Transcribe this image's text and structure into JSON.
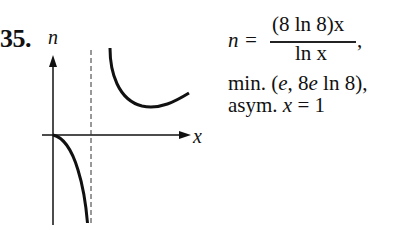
{
  "problem": {
    "number": "35."
  },
  "graph": {
    "y_axis_label": "n",
    "x_axis_label": "x",
    "asymptote": "x = 1 (dashed vertical line)",
    "curves": [
      {
        "name": "left-branch",
        "description": "from origin decreasing to -infinity as x approaches 1 from the left"
      },
      {
        "name": "right-branch",
        "description": "from +infinity near x = 1, decreasing to minimum at (e, 8e ln 8), then increasing"
      }
    ]
  },
  "equation": {
    "lhs": "n =",
    "numerator": "(8 ln 8)x",
    "denominator": "ln x",
    "trailing": ","
  },
  "notes": {
    "min_prefix": "min. (",
    "min_e": "e",
    "min_mid": ", 8",
    "min_e2": "e",
    "min_suffix": " ln 8),",
    "asym_prefix": "asym. ",
    "asym_var": "x",
    "asym_suffix": " = 1"
  },
  "colors": {
    "ink": "#111111",
    "background": "#ffffff"
  }
}
